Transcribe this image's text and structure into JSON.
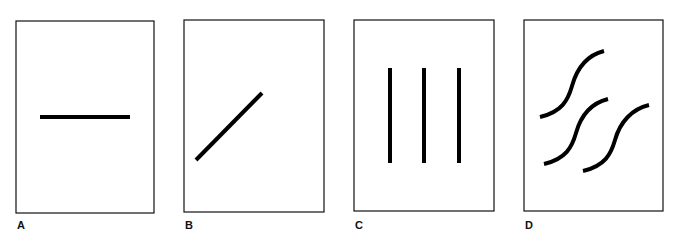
{
  "panels": [
    {
      "label": "A",
      "description": "single horizontal line",
      "frame": {
        "x": 16,
        "y": 21,
        "w": 138,
        "h": 192
      },
      "shapes": [
        {
          "type": "line",
          "x1": 40,
          "y1": 117,
          "x2": 130,
          "y2": 117
        }
      ],
      "label_pos": {
        "x": 17,
        "y": 220
      }
    },
    {
      "label": "B",
      "description": "single diagonal line",
      "frame": {
        "x": 184,
        "y": 20,
        "w": 140,
        "h": 192
      },
      "shapes": [
        {
          "type": "line",
          "x1": 196,
          "y1": 160,
          "x2": 262,
          "y2": 93
        }
      ],
      "label_pos": {
        "x": 185,
        "y": 220
      }
    },
    {
      "label": "C",
      "description": "three parallel vertical lines",
      "frame": {
        "x": 354,
        "y": 20,
        "w": 140,
        "h": 191
      },
      "shapes": [
        {
          "type": "line",
          "x1": 390,
          "y1": 68,
          "x2": 390,
          "y2": 163
        },
        {
          "type": "line",
          "x1": 424,
          "y1": 68,
          "x2": 424,
          "y2": 163
        },
        {
          "type": "line",
          "x1": 459,
          "y1": 68,
          "x2": 459,
          "y2": 163
        }
      ],
      "label_pos": {
        "x": 355,
        "y": 220
      }
    },
    {
      "label": "D",
      "description": "three S-shaped curves",
      "frame": {
        "x": 524,
        "y": 20,
        "w": 139,
        "h": 191
      },
      "shapes": [
        {
          "type": "path",
          "d": "M540 117 C 562 112, 568 100, 572 86 C 577 68, 588 55, 604 51"
        },
        {
          "type": "path",
          "d": "M544 164 C 566 159, 572 147, 576 133 C 581 115, 592 103, 608 99"
        },
        {
          "type": "path",
          "d": "M583 171 C 605 166, 611 154, 615 140 C 620 122, 632 109, 649 105"
        }
      ],
      "label_pos": {
        "x": 525,
        "y": 220
      }
    }
  ],
  "style": {
    "stroke": "#000000",
    "frame_stroke": "#111111",
    "line_width": 4,
    "frame_width": 1.2
  }
}
